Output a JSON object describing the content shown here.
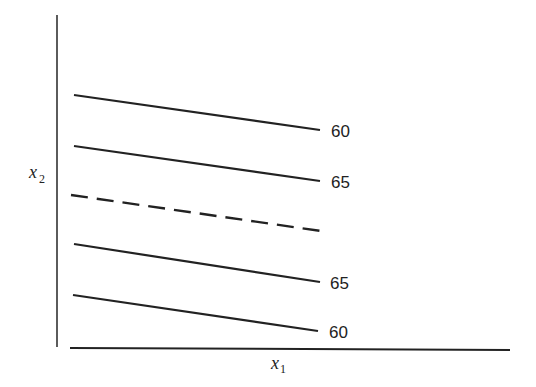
{
  "diagram": {
    "axes": {
      "x_label": "x",
      "x_subscript": "1",
      "y_label": "x",
      "y_subscript": "2"
    },
    "contours": [
      {
        "label": "60",
        "style": "solid"
      },
      {
        "label": "65",
        "style": "solid"
      },
      {
        "label": "",
        "style": "dashed"
      },
      {
        "label": "65",
        "style": "solid"
      },
      {
        "label": "60",
        "style": "solid"
      }
    ]
  }
}
